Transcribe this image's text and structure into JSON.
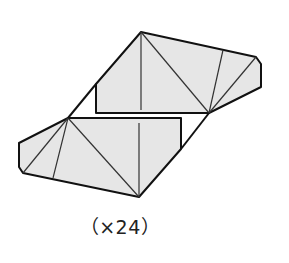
{
  "caption_top": "fig (cut off)",
  "figure": {
    "fill": "#e6e6e6",
    "stroke": "#111111",
    "inner_stroke": "#333333",
    "upper_piece": {
      "outline": "96,84 141,32 256,57 261,64 261,87 209,113 96,113",
      "creases": [
        "141,32 141,110",
        "141,32 209,113",
        "209,113 223,50",
        "209,113 256,57"
      ]
    },
    "lower_piece": {
      "outline": "68,118 181,118 181,149 139,197 23,173 19,167 19,143",
      "creases": [
        "139,197 139,123",
        "68,118 139,197",
        "68,118 53,178",
        "68,118 23,173"
      ]
    },
    "connectors": [
      "68,118 96,84",
      "181,149 209,113"
    ]
  },
  "label": "（×24）"
}
